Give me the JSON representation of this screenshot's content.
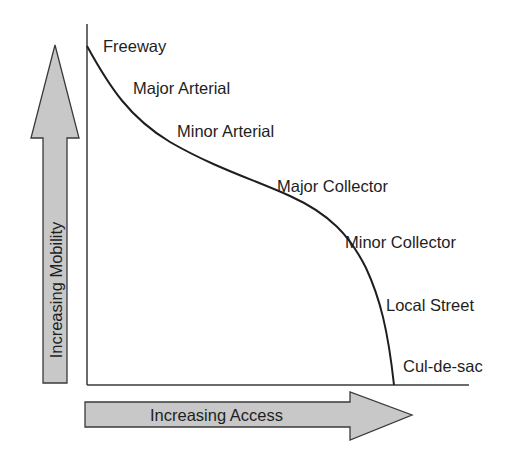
{
  "diagram": {
    "type": "functional-classification-curve",
    "y_axis_arrow": {
      "label": "Increasing Mobility",
      "fill": "#c8c8c8",
      "stroke": "#3a3a3a"
    },
    "x_axis_arrow": {
      "label": "Increasing Access",
      "fill": "#c8c8c8",
      "stroke": "#3a3a3a"
    },
    "curve_color": "#1e1e1e",
    "labels": [
      {
        "text": "Freeway"
      },
      {
        "text": "Major Arterial"
      },
      {
        "text": "Minor Arterial"
      },
      {
        "text": "Major Collector"
      },
      {
        "text": "Minor Collector"
      },
      {
        "text": "Local Street"
      },
      {
        "text": "Cul-de-sac"
      }
    ]
  }
}
